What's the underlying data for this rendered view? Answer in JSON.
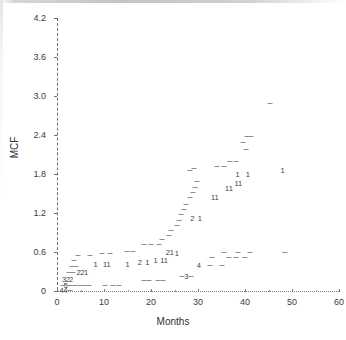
{
  "chart_data": {
    "type": "scatter",
    "title": "",
    "xlabel": "Months",
    "ylabel": "MCF",
    "xlim": [
      0,
      60
    ],
    "ylim": [
      0,
      4.2
    ],
    "grid": false,
    "legend": null,
    "xticks": [
      0,
      10,
      20,
      30,
      40,
      50,
      60
    ],
    "xtick_labels": [
      "0",
      "10",
      "20",
      "30",
      "40",
      "50",
      "60"
    ],
    "yticks": [
      0,
      0.6,
      1.2,
      1.8,
      2.4,
      3.0,
      3.6,
      4.2
    ],
    "ytick_labels": [
      "0",
      "0.6",
      "1.2",
      "1.8",
      "2.4",
      "3.0",
      "3.6",
      "4.2"
    ],
    "marker_note": "Overplotted points are drawn as a digit giving the number of coincident observations; single observations are drawn as a short dash.",
    "points": [
      {
        "x": 1.0,
        "y": 0.02,
        "label": "4"
      },
      {
        "x": 1.8,
        "y": 0.02,
        "label": "4"
      },
      {
        "x": 2.8,
        "y": 0.02,
        "label": "-"
      },
      {
        "x": 1.2,
        "y": 0.1,
        "label": "-"
      },
      {
        "x": 1.9,
        "y": 0.1,
        "label": "5"
      },
      {
        "x": 2.8,
        "y": 0.1,
        "label": "-"
      },
      {
        "x": 3.8,
        "y": 0.1,
        "label": "-"
      },
      {
        "x": 4.8,
        "y": 0.1,
        "label": "-"
      },
      {
        "x": 5.8,
        "y": 0.1,
        "label": "-"
      },
      {
        "x": 6.8,
        "y": 0.1,
        "label": "-"
      },
      {
        "x": 10.2,
        "y": 0.1,
        "label": "-"
      },
      {
        "x": 12.0,
        "y": 0.1,
        "label": "-"
      },
      {
        "x": 13.2,
        "y": 0.1,
        "label": "-"
      },
      {
        "x": 1.5,
        "y": 0.19,
        "label": "3"
      },
      {
        "x": 2.3,
        "y": 0.19,
        "label": "2"
      },
      {
        "x": 3.0,
        "y": 0.19,
        "label": "2"
      },
      {
        "x": 18.5,
        "y": 0.17,
        "label": "-"
      },
      {
        "x": 19.6,
        "y": 0.17,
        "label": "-"
      },
      {
        "x": 21.5,
        "y": 0.17,
        "label": "-"
      },
      {
        "x": 22.6,
        "y": 0.17,
        "label": "-"
      },
      {
        "x": 2.6,
        "y": 0.29,
        "label": "-"
      },
      {
        "x": 3.4,
        "y": 0.29,
        "label": "-"
      },
      {
        "x": 4.6,
        "y": 0.3,
        "label": "2"
      },
      {
        "x": 5.4,
        "y": 0.3,
        "label": "2"
      },
      {
        "x": 6.2,
        "y": 0.3,
        "label": "1"
      },
      {
        "x": 27.5,
        "y": 0.23,
        "label": "3"
      },
      {
        "x": 26.5,
        "y": 0.23,
        "label": "-"
      },
      {
        "x": 28.6,
        "y": 0.23,
        "label": "-"
      },
      {
        "x": 3.2,
        "y": 0.39,
        "label": "-"
      },
      {
        "x": 4.1,
        "y": 0.39,
        "label": "-"
      },
      {
        "x": 3.6,
        "y": 0.47,
        "label": "-"
      },
      {
        "x": 8.2,
        "y": 0.42,
        "label": "1"
      },
      {
        "x": 10.6,
        "y": 0.42,
        "label": "11"
      },
      {
        "x": 15.0,
        "y": 0.42,
        "label": "1"
      },
      {
        "x": 17.6,
        "y": 0.44,
        "label": "2"
      },
      {
        "x": 19.2,
        "y": 0.44,
        "label": "1"
      },
      {
        "x": 21.0,
        "y": 0.48,
        "label": "1"
      },
      {
        "x": 22.8,
        "y": 0.48,
        "label": "11"
      },
      {
        "x": 30.2,
        "y": 0.4,
        "label": "4"
      },
      {
        "x": 32.6,
        "y": 0.4,
        "label": "-"
      },
      {
        "x": 35.2,
        "y": 0.4,
        "label": "-"
      },
      {
        "x": 4.5,
        "y": 0.56,
        "label": "-"
      },
      {
        "x": 7.0,
        "y": 0.56,
        "label": "-"
      },
      {
        "x": 9.6,
        "y": 0.58,
        "label": "-"
      },
      {
        "x": 11.2,
        "y": 0.58,
        "label": "-"
      },
      {
        "x": 25.5,
        "y": 0.58,
        "label": "1"
      },
      {
        "x": 24.0,
        "y": 0.6,
        "label": "21"
      },
      {
        "x": 14.8,
        "y": 0.62,
        "label": "-"
      },
      {
        "x": 16.2,
        "y": 0.62,
        "label": "-"
      },
      {
        "x": 35.5,
        "y": 0.6,
        "label": "-"
      },
      {
        "x": 38.5,
        "y": 0.6,
        "label": "-"
      },
      {
        "x": 41.0,
        "y": 0.6,
        "label": "-"
      },
      {
        "x": 48.5,
        "y": 0.6,
        "label": "-"
      },
      {
        "x": 33.0,
        "y": 0.52,
        "label": "-"
      },
      {
        "x": 36.5,
        "y": 0.52,
        "label": "-"
      },
      {
        "x": 38.0,
        "y": 0.52,
        "label": "-"
      },
      {
        "x": 40.0,
        "y": 0.52,
        "label": "-"
      },
      {
        "x": 18.5,
        "y": 0.72,
        "label": "-"
      },
      {
        "x": 20.0,
        "y": 0.72,
        "label": "-"
      },
      {
        "x": 21.6,
        "y": 0.72,
        "label": "-"
      },
      {
        "x": 22.4,
        "y": 0.8,
        "label": "-"
      },
      {
        "x": 23.8,
        "y": 0.86,
        "label": "-"
      },
      {
        "x": 24.2,
        "y": 0.94,
        "label": "-"
      },
      {
        "x": 25.6,
        "y": 1.02,
        "label": "-"
      },
      {
        "x": 26.0,
        "y": 1.1,
        "label": "-"
      },
      {
        "x": 26.4,
        "y": 1.18,
        "label": "-"
      },
      {
        "x": 27.0,
        "y": 1.26,
        "label": "-"
      },
      {
        "x": 27.4,
        "y": 1.34,
        "label": "-"
      },
      {
        "x": 28.8,
        "y": 1.12,
        "label": "2"
      },
      {
        "x": 30.4,
        "y": 1.12,
        "label": "1"
      },
      {
        "x": 28.4,
        "y": 1.44,
        "label": "-"
      },
      {
        "x": 29.0,
        "y": 1.52,
        "label": "-"
      },
      {
        "x": 29.4,
        "y": 1.6,
        "label": "-"
      },
      {
        "x": 29.8,
        "y": 1.7,
        "label": "-"
      },
      {
        "x": 28.4,
        "y": 1.86,
        "label": "-"
      },
      {
        "x": 29.2,
        "y": 1.9,
        "label": "-"
      },
      {
        "x": 33.6,
        "y": 1.44,
        "label": "11"
      },
      {
        "x": 36.6,
        "y": 1.58,
        "label": "11"
      },
      {
        "x": 38.6,
        "y": 1.66,
        "label": "11"
      },
      {
        "x": 38.4,
        "y": 1.8,
        "label": "1"
      },
      {
        "x": 40.6,
        "y": 1.8,
        "label": "1"
      },
      {
        "x": 48.0,
        "y": 1.86,
        "label": "1"
      },
      {
        "x": 34.0,
        "y": 1.92,
        "label": "-"
      },
      {
        "x": 35.6,
        "y": 1.92,
        "label": "-"
      },
      {
        "x": 36.8,
        "y": 2.0,
        "label": "-"
      },
      {
        "x": 38.0,
        "y": 2.0,
        "label": "-"
      },
      {
        "x": 40.2,
        "y": 2.18,
        "label": "-"
      },
      {
        "x": 39.6,
        "y": 2.3,
        "label": "-"
      },
      {
        "x": 40.4,
        "y": 2.38,
        "label": "-"
      },
      {
        "x": 41.2,
        "y": 2.38,
        "label": "-"
      },
      {
        "x": 45.4,
        "y": 2.9,
        "label": "-"
      }
    ]
  }
}
